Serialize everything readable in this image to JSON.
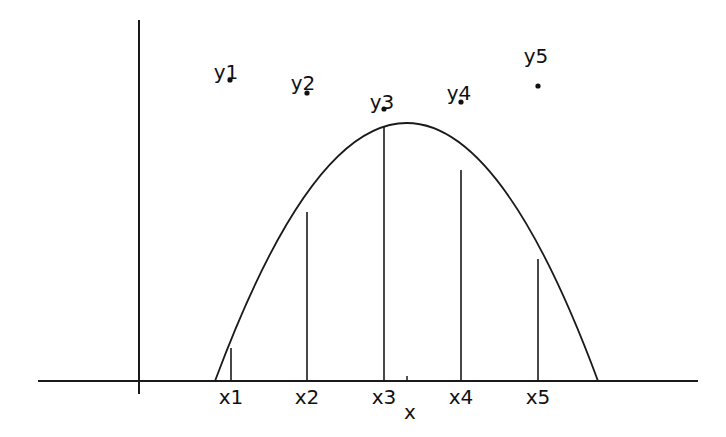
{
  "diagram": {
    "type": "function-sampling",
    "axis_label_x": "x",
    "stroke_color": "#1a1a1a",
    "background": "#ffffff",
    "x_ticks": [
      {
        "label": "x1",
        "px": 231,
        "curve_top": 348
      },
      {
        "label": "x2",
        "px": 307,
        "curve_top": 212
      },
      {
        "label": "x3",
        "px": 384,
        "curve_top": 126
      },
      {
        "label": "x4",
        "px": 461,
        "curve_top": 170
      },
      {
        "label": "x5",
        "px": 538,
        "curve_top": 259
      }
    ],
    "points": [
      {
        "label": "y1",
        "px": 230,
        "py": 80
      },
      {
        "label": "y2",
        "px": 307,
        "py": 93
      },
      {
        "label": "y3",
        "px": 384,
        "py": 109
      },
      {
        "label": "y4",
        "px": 461,
        "py": 102
      },
      {
        "label": "y5",
        "px": 538,
        "py": 86
      }
    ]
  }
}
